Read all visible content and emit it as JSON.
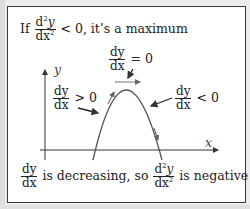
{
  "title": {
    "prefix": "If",
    "frac_num_d": "d",
    "frac_num_exp": "2",
    "frac_num_y": "y",
    "frac_den_dx": "dx",
    "frac_den_exp": "2",
    "suffix": "< 0, it’s a maximum"
  },
  "labels": {
    "peak_num": "dy",
    "peak_den": "dx",
    "peak_rel": "= 0",
    "left_num": "dy",
    "left_den": "dx",
    "left_rel": "> 0",
    "right_num": "dy",
    "right_den": "dx",
    "right_rel": "< 0",
    "y_axis": "y",
    "x_axis": "x"
  },
  "footer": {
    "frac1_num": "dy",
    "frac1_den": "dx",
    "text1": "is decreasing, so",
    "frac2_num_d": "d",
    "frac2_num_exp": "2",
    "frac2_num_y": "y",
    "frac2_den_dx": "dx",
    "frac2_den_exp": "2",
    "text2": "is negative"
  },
  "colors": {
    "curve": "#555555",
    "axis": "#333333",
    "arrow": "#222222",
    "border": "#3a3a3a",
    "background": "#ececec"
  }
}
